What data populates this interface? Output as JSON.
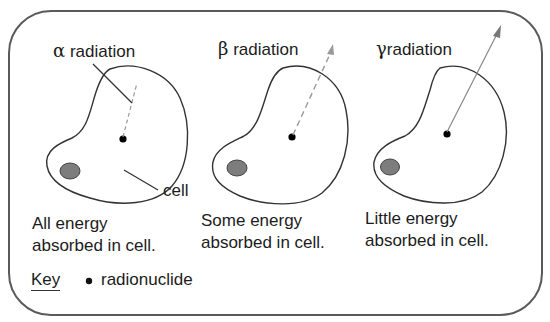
{
  "diagram": {
    "panels": [
      {
        "id": "alpha",
        "symbol": "α",
        "label": "radiation",
        "caption_line1": "All energy",
        "caption_line2": "absorbed in cell."
      },
      {
        "id": "beta",
        "symbol": "β",
        "label": "radiation",
        "caption_line1": "Some energy",
        "caption_line2": "absorbed in cell."
      },
      {
        "id": "gamma",
        "symbol": "γ",
        "label": "radiation",
        "caption_line1": "Little energy",
        "caption_line2": "absorbed in cell."
      }
    ],
    "cell_label": "cell",
    "key": {
      "title": "Key",
      "bullet": "•",
      "item": "radionuclide"
    },
    "colors": {
      "border": "#555555",
      "outline": "#333333",
      "nucleus_fill": "#808080",
      "ray": "#8a8a8a",
      "dot": "#000000"
    }
  }
}
